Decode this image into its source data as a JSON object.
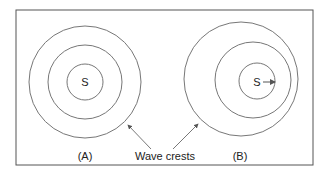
{
  "diagram": {
    "panel_a": {
      "label": "(A)",
      "source_label": "S"
    },
    "panel_b": {
      "label": "(B)",
      "source_label": "S"
    },
    "annotation": "Wave crests"
  },
  "colors": {
    "stroke": "#777777",
    "frame": "#555555",
    "text": "#222222"
  }
}
